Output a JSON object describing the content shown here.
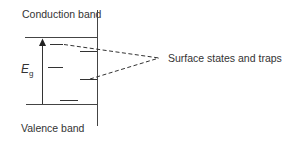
{
  "diagram": {
    "labels": {
      "conduction_band": "Conduction band",
      "valence_band": "Valence band",
      "surface_states": "Surface states and traps",
      "energy_gap_symbol": "E",
      "energy_gap_subscript": "g"
    },
    "colors": {
      "line": "#333333",
      "background": "#ffffff"
    }
  }
}
